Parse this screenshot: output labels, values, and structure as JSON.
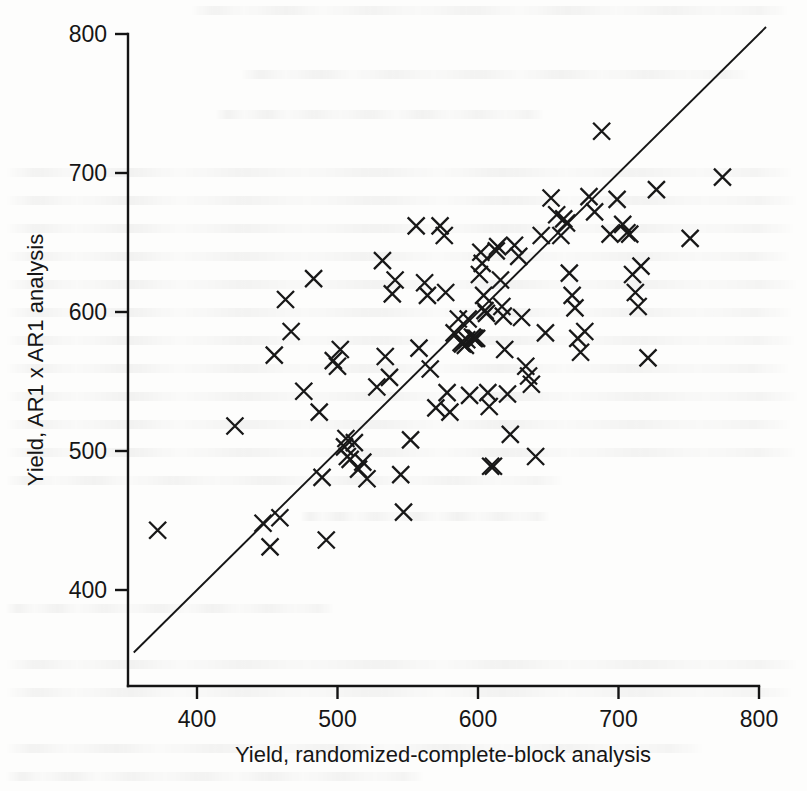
{
  "figure": {
    "kind": "scatter-plot",
    "background_color": "#fdfdfc",
    "ink_color": "#181818",
    "marker_glyph": "x-cross-marker",
    "has_reference_line": true,
    "reference_line_name": "one-to-one-line"
  },
  "axes": {
    "x": {
      "label": "Yield, randomized-complete-block analysis",
      "ticks": [
        "400",
        "500",
        "600",
        "700",
        "800"
      ]
    },
    "y": {
      "label": "Yield, AR1 x AR1 analysis",
      "ticks": [
        "800",
        "700",
        "600",
        "500",
        "400"
      ]
    }
  },
  "chart_data": {
    "type": "scatter",
    "title": "",
    "xlabel": "Yield, randomized-complete-block analysis",
    "ylabel": "Yield, AR1 x AR1 analysis",
    "xlim": [
      355,
      810
    ],
    "ylim": [
      355,
      810
    ],
    "xticks": [
      400,
      500,
      600,
      700,
      800
    ],
    "yticks": [
      400,
      500,
      600,
      700,
      800
    ],
    "grid": false,
    "legend": null,
    "marker": "x",
    "reference_line": {
      "name": "y = x",
      "from": [
        355,
        355
      ],
      "to": [
        805,
        805
      ]
    },
    "series": [
      {
        "name": "Plot yields",
        "points": [
          [
            372,
            443
          ],
          [
            427,
            518
          ],
          [
            447,
            448
          ],
          [
            452,
            431
          ],
          [
            455,
            569
          ],
          [
            459,
            452
          ],
          [
            463,
            609
          ],
          [
            467,
            586
          ],
          [
            476,
            543
          ],
          [
            483,
            624
          ],
          [
            487,
            528
          ],
          [
            489,
            481
          ],
          [
            492,
            436
          ],
          [
            497,
            565
          ],
          [
            500,
            561
          ],
          [
            502,
            573
          ],
          [
            505,
            503
          ],
          [
            506,
            509
          ],
          [
            507,
            496
          ],
          [
            509,
            494
          ],
          [
            512,
            506
          ],
          [
            515,
            487
          ],
          [
            518,
            492
          ],
          [
            521,
            480
          ],
          [
            528,
            546
          ],
          [
            532,
            637
          ],
          [
            534,
            568
          ],
          [
            537,
            553
          ],
          [
            539,
            613
          ],
          [
            541,
            623
          ],
          [
            545,
            483
          ],
          [
            547,
            456
          ],
          [
            552,
            508
          ],
          [
            556,
            662
          ],
          [
            558,
            574
          ],
          [
            562,
            621
          ],
          [
            564,
            612
          ],
          [
            566,
            559
          ],
          [
            570,
            531
          ],
          [
            573,
            662
          ],
          [
            576,
            655
          ],
          [
            577,
            614
          ],
          [
            578,
            542
          ],
          [
            580,
            528
          ],
          [
            583,
            585
          ],
          [
            586,
            595
          ],
          [
            588,
            578
          ],
          [
            589,
            577
          ],
          [
            591,
            576
          ],
          [
            592,
            580
          ],
          [
            593,
            595
          ],
          [
            594,
            540
          ],
          [
            596,
            582
          ],
          [
            597,
            581
          ],
          [
            598,
            581
          ],
          [
            599,
            581
          ],
          [
            601,
            627
          ],
          [
            602,
            643
          ],
          [
            603,
            635
          ],
          [
            604,
            612
          ],
          [
            605,
            601
          ],
          [
            606,
            599
          ],
          [
            607,
            542
          ],
          [
            608,
            532
          ],
          [
            609,
            489
          ],
          [
            611,
            489
          ],
          [
            613,
            644
          ],
          [
            614,
            647
          ],
          [
            616,
            623
          ],
          [
            617,
            604
          ],
          [
            618,
            597
          ],
          [
            619,
            573
          ],
          [
            621,
            541
          ],
          [
            623,
            512
          ],
          [
            626,
            648
          ],
          [
            629,
            640
          ],
          [
            631,
            596
          ],
          [
            634,
            561
          ],
          [
            636,
            554
          ],
          [
            638,
            548
          ],
          [
            641,
            496
          ],
          [
            645,
            655
          ],
          [
            648,
            585
          ],
          [
            652,
            682
          ],
          [
            656,
            670
          ],
          [
            659,
            655
          ],
          [
            661,
            667
          ],
          [
            663,
            664
          ],
          [
            665,
            628
          ],
          [
            667,
            612
          ],
          [
            669,
            603
          ],
          [
            671,
            581
          ],
          [
            673,
            571
          ],
          [
            676,
            586
          ],
          [
            679,
            683
          ],
          [
            683,
            672
          ],
          [
            688,
            730
          ],
          [
            694,
            656
          ],
          [
            699,
            681
          ],
          [
            703,
            663
          ],
          [
            706,
            657
          ],
          [
            708,
            656
          ],
          [
            710,
            627
          ],
          [
            712,
            614
          ],
          [
            714,
            604
          ],
          [
            716,
            633
          ],
          [
            721,
            567
          ],
          [
            727,
            688
          ],
          [
            751,
            653
          ],
          [
            774,
            697
          ]
        ]
      }
    ]
  }
}
